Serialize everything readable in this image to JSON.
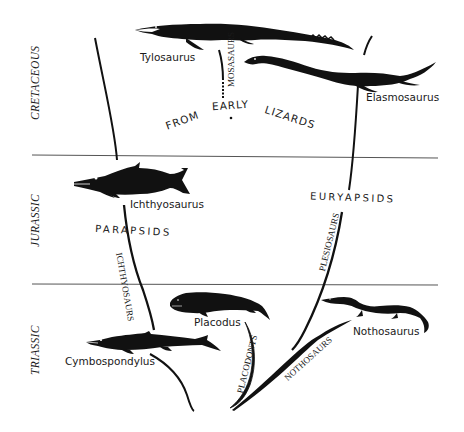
{
  "periods": {
    "cretaceous": "CRETACEOUS",
    "jurassic": "JURASSIC",
    "triassic": "TRIASSIC"
  },
  "groups": {
    "parapsids": "PARAPSIDS",
    "euryapsids": "EURYAPSIDS"
  },
  "lineages": {
    "mosasaurs": "MOSASAURS",
    "ichthyosaurs": "ICHTHYOSAURS",
    "plesiosaurs": "PLESIOSAURS",
    "placodonts": "PLACODONTS",
    "nothosaurs": "NOTHOSAURS"
  },
  "origin_note": {
    "word1": "FROM",
    "word2": "EARLY",
    "word3": "LIZARDS"
  },
  "animals": {
    "tylosaurus": "Tylosaurus",
    "elasmosaurus": "Elasmosaurus",
    "ichthyosaurus": "Ichthyosaurus",
    "cymbospondylus": "Cymbospondylus",
    "placodus": "Placodus",
    "nothosaurus": "Nothosaurus"
  },
  "colors": {
    "ink": "#111111",
    "divider": "#555555",
    "background": "#ffffff"
  }
}
